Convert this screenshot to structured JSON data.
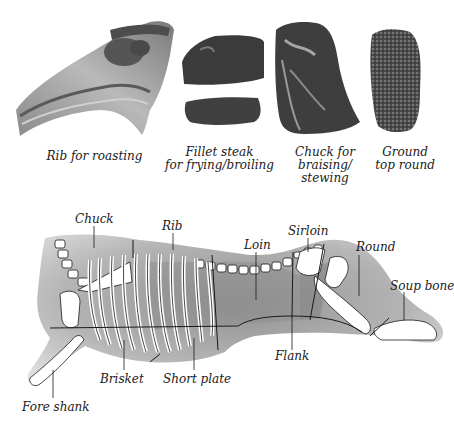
{
  "photos": [
    {
      "id": "rib",
      "caption": "Rib for roasting"
    },
    {
      "id": "fillet",
      "caption": "Fillet steak\nfor frying/broiling"
    },
    {
      "id": "chuck",
      "caption": "Chuck for\nbraising/\nstewing"
    },
    {
      "id": "ground",
      "caption": "Ground\ntop round"
    }
  ],
  "diagram": {
    "labels": {
      "chuck": "Chuck",
      "rib": "Rib",
      "loin": "Loin",
      "sirloin": "Sirloin",
      "round": "Round",
      "soup_bone": "Soup bone",
      "flank": "Flank",
      "short_plate": "Short plate",
      "brisket": "Brisket",
      "fore_shank": "Fore shank"
    }
  },
  "colors": {
    "meat_dark": "#3a3a3a",
    "meat_mid": "#6e6e6e",
    "fat": "#d8d8d8",
    "carcass_light": "#cfcfcf",
    "carcass_dark": "#9a9a9a",
    "bone": "#ffffff",
    "line": "#1a1a1a"
  }
}
